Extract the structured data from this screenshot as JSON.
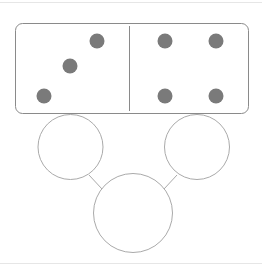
{
  "diagram": {
    "colors": {
      "pip": "#7a7a7a",
      "stroke": "#8a8a8a",
      "circle_stroke": "#aaaaaa",
      "rule": "#e2e2e2"
    },
    "domino": {
      "left_value": 3,
      "right_value": 4
    },
    "circles": 3
  }
}
